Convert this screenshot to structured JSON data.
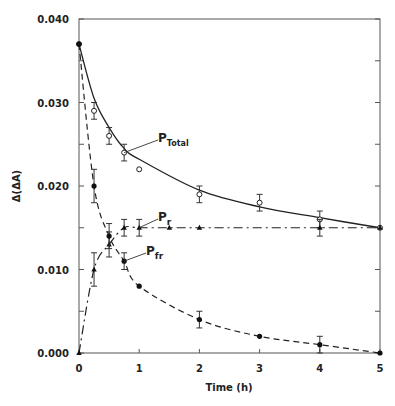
{
  "chart_data": {
    "type": "line",
    "title": "",
    "xlabel": "Time (h)",
    "ylabel": "Δ(ΔA)",
    "xlim": [
      0,
      5
    ],
    "ylim": [
      0.0,
      0.04
    ],
    "xticks": [
      0,
      1,
      2,
      3,
      4,
      5
    ],
    "xtick_labels": [
      "0",
      "1",
      "2",
      "3",
      "4",
      "5"
    ],
    "yticks": [
      0.0,
      0.01,
      0.02,
      0.03,
      0.04
    ],
    "ytick_labels": [
      "0.000",
      "0.010",
      "0.020",
      "0.030",
      "0.040"
    ],
    "grid": false,
    "legend": "inline labels",
    "series": [
      {
        "name": "P_Total",
        "label_main": "P",
        "label_sub": "Total",
        "marker": "open-circle",
        "line_style": "solid",
        "x": [
          0,
          0.25,
          0.5,
          0.75,
          1,
          2,
          3,
          4,
          5
        ],
        "values": [
          0.037,
          0.029,
          0.026,
          0.024,
          0.022,
          0.019,
          0.018,
          0.016,
          0.015
        ],
        "error": [
          0,
          0.001,
          0.001,
          0.001,
          0,
          0.001,
          0.001,
          0.001,
          0
        ],
        "fit": [
          0.037,
          0.0305,
          0.027,
          0.0245,
          0.0232,
          0.0195,
          0.0175,
          0.0162,
          0.015
        ]
      },
      {
        "name": "P_r",
        "label_main": "P",
        "label_sub": "r",
        "marker": "filled-triangle",
        "line_style": "dash-dot",
        "x": [
          0,
          0.25,
          0.5,
          0.75,
          1,
          1.5,
          2,
          4,
          5
        ],
        "values": [
          0.0,
          0.01,
          0.013,
          0.015,
          0.015,
          0.015,
          0.015,
          0.015,
          0.015
        ],
        "error": [
          0,
          0.002,
          0.0015,
          0.001,
          0.001,
          0,
          0,
          0.001,
          0
        ]
      },
      {
        "name": "P_fr",
        "label_main": "P",
        "label_sub": "fr",
        "marker": "filled-circle",
        "line_style": "dashed",
        "x": [
          0,
          0.25,
          0.5,
          0.75,
          1,
          2,
          3,
          4,
          5
        ],
        "values": [
          0.037,
          0.02,
          0.014,
          0.011,
          0.008,
          0.004,
          0.002,
          0.001,
          0.0
        ],
        "error": [
          0,
          0.002,
          0.0015,
          0.001,
          0,
          0.001,
          0,
          0.001,
          0
        ]
      }
    ]
  }
}
